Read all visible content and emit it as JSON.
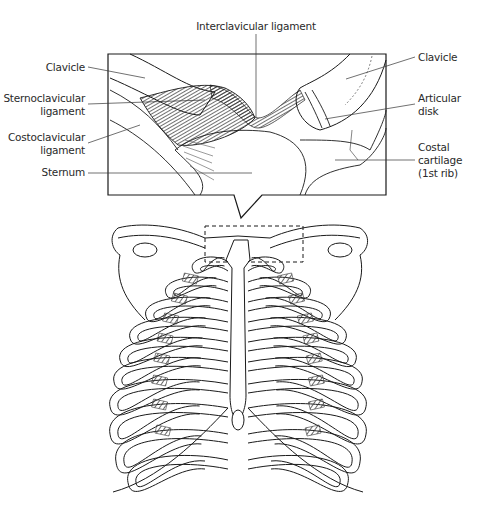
{
  "figure": {
    "top_label": "Interclavicular ligament",
    "left_labels": [
      {
        "lines": [
          "Clavicle"
        ]
      },
      {
        "lines": [
          "Sternoclavicular",
          "ligament"
        ]
      },
      {
        "lines": [
          "Costoclavicular",
          "ligament"
        ]
      },
      {
        "lines": [
          "Sternum"
        ]
      }
    ],
    "right_labels": [
      {
        "lines": [
          "Clavicle"
        ]
      },
      {
        "lines": [
          "Articular",
          "disk"
        ]
      },
      {
        "lines": [
          "Costal",
          "cartilage",
          "(1st rib)"
        ]
      }
    ],
    "inset_region": "sternoclavicular joint (magnified)",
    "main_illustration": "anterior view of thoracic cage"
  },
  "colors": {
    "line": "#1a1a1a",
    "hatch": "#555555",
    "text": "#2a2a2a",
    "background": "#ffffff"
  }
}
